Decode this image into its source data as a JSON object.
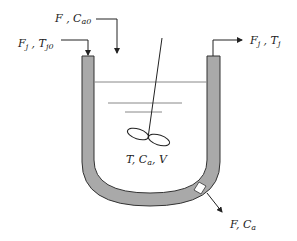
{
  "diagram": {
    "type": "jacketed CSTR schematic",
    "colors": {
      "jacket_fill": "#a9a9a9",
      "stroke": "#333333",
      "liquid_line": "#888888",
      "background": "#ffffff"
    },
    "labels": {
      "feed": {
        "main": "F , C",
        "sub": "a0"
      },
      "jacket_inlet": {
        "main1": "F",
        "sub1": "j",
        "sep": " , T",
        "sub2": "j0"
      },
      "jacket_outlet": {
        "main1": "F",
        "sub1": "j",
        "sep": " , T",
        "sub2": "j"
      },
      "reactor_contents": {
        "p1": "T, C",
        "sub": "a",
        "p2": ", V"
      },
      "outlet": {
        "main": "F, C",
        "sub": "a"
      }
    },
    "streams": [
      {
        "name": "feed",
        "direction": "in",
        "label": "F, Ca0"
      },
      {
        "name": "jacket-inlet",
        "direction": "in",
        "label": "Fj, Tj0"
      },
      {
        "name": "jacket-outlet",
        "direction": "out",
        "label": "Fj, Tj"
      },
      {
        "name": "product-outlet",
        "direction": "out",
        "label": "F, Ca"
      }
    ],
    "vessel_state": "T, Ca, V"
  }
}
